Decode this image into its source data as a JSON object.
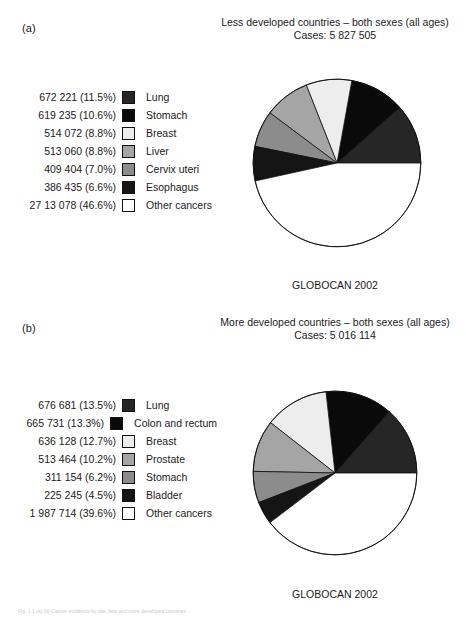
{
  "figure": {
    "caption": "Fig. 1.1 (a) (b) Cancer incidence by site, less and more developed countries"
  },
  "panels": [
    {
      "key": "a",
      "panel_label": "(a)",
      "title_line1": "Less developed countries – both sexes (all ages)",
      "title_line2": "Cases: 5 827 505",
      "source": "GLOBOCAN 2002",
      "legend": [
        {
          "value": "672 221 (11.5%)",
          "label": "Lung",
          "color": "#262626"
        },
        {
          "value": "619 235 (10.6%)",
          "label": "Stomach",
          "color": "#0a0a0a"
        },
        {
          "value": "514 072 (8.8%)",
          "label": "Breast",
          "color": "#ededed"
        },
        {
          "value": "513 060 (8.8%)",
          "label": "Liver",
          "color": "#a5a5a5"
        },
        {
          "value": "409 404 (7.0%)",
          "label": "Cervix uteri",
          "color": "#8c8c8c"
        },
        {
          "value": "386 435 (6.6%)",
          "label": "Esophagus",
          "color": "#151515"
        },
        {
          "value": "27 13 078 (46.6%)",
          "label": "Other cancers",
          "color": "#ffffff"
        }
      ]
    },
    {
      "key": "b",
      "panel_label": "(b)",
      "title_line1": "More developed countries – both sexes (all ages)",
      "title_line2": "Cases: 5 016 114",
      "source": "GLOBOCAN 2002",
      "legend": [
        {
          "value": "676 681 (13.5%)",
          "label": "Lung",
          "color": "#262626"
        },
        {
          "value": "665 731 (13.3%)",
          "label": "Colon and rectum",
          "color": "#0a0a0a"
        },
        {
          "value": "636 128 (12.7%)",
          "label": "Breast",
          "color": "#ededed"
        },
        {
          "value": "513 464 (10.2%)",
          "label": "Prostate",
          "color": "#a5a5a5"
        },
        {
          "value": "311 154 (6.2%)",
          "label": "Stomach",
          "color": "#8c8c8c"
        },
        {
          "value": "225 245 (4.5%)",
          "label": "Bladder",
          "color": "#151515"
        },
        {
          "value": "1 987 714 (39.6%)",
          "label": "Other cancers",
          "color": "#ffffff"
        }
      ]
    }
  ],
  "chart_data": [
    {
      "type": "pie",
      "title": "Less developed countries – both sexes (all ages)",
      "subtitle": "Cases: 5 827 505",
      "total_cases": 5827505,
      "source": "GLOBOCAN 2002",
      "start_angle_deg": 0,
      "direction": "counterclockwise",
      "legend_position": "left",
      "categories": [
        "Lung",
        "Stomach",
        "Breast",
        "Liver",
        "Cervix uteri",
        "Esophagus",
        "Other cancers"
      ],
      "values": [
        672221,
        619235,
        514072,
        513060,
        409404,
        386435,
        2713078
      ],
      "percents": [
        11.5,
        10.6,
        8.8,
        8.8,
        7.0,
        6.6,
        46.6
      ],
      "colors": [
        "#262626",
        "#0a0a0a",
        "#ededed",
        "#a5a5a5",
        "#8c8c8c",
        "#151515",
        "#ffffff"
      ]
    },
    {
      "type": "pie",
      "title": "More developed countries – both sexes (all ages)",
      "subtitle": "Cases: 5 016 114",
      "total_cases": 5016114,
      "source": "GLOBOCAN 2002",
      "start_angle_deg": 0,
      "direction": "counterclockwise",
      "legend_position": "left",
      "categories": [
        "Lung",
        "Colon and rectum",
        "Breast",
        "Prostate",
        "Stomach",
        "Bladder",
        "Other cancers"
      ],
      "values": [
        676681,
        665731,
        636128,
        513464,
        311154,
        225245,
        1987714
      ],
      "percents": [
        13.5,
        13.3,
        12.7,
        10.2,
        6.2,
        4.5,
        39.6
      ],
      "colors": [
        "#262626",
        "#0a0a0a",
        "#ededed",
        "#a5a5a5",
        "#8c8c8c",
        "#151515",
        "#ffffff"
      ]
    }
  ]
}
